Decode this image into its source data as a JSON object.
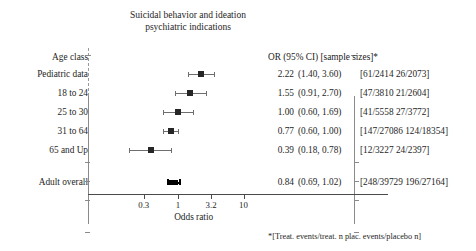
{
  "title": {
    "line1": "Suicidal behavior and ideation",
    "line2": "psychiatric indications"
  },
  "columns": {
    "left_header": "Age class",
    "right_header": "OR (95% CI)   [sample sizes]*"
  },
  "footnote": "*[Treat. events/treat. n   plac. events/placebo n]",
  "axis": {
    "label": "Odds ratio",
    "ticks": [
      "0.3",
      "1",
      "3.2",
      "10"
    ],
    "tick_values": [
      0.3,
      1,
      3.2,
      10
    ],
    "reference_line": 1,
    "scale": "log"
  },
  "colors": {
    "marker": "#262626",
    "overall_marker": "#000000",
    "ci_line": "#6e6e6e",
    "reference_line": "#9a9a9a",
    "axis": "#4a4a4a",
    "text": "#1e1e1e",
    "background": "#ffffff"
  },
  "chart_data": {
    "type": "forest",
    "title": "Suicidal behavior and ideation psychiatric indications",
    "xlabel": "Odds ratio",
    "ylabel": "Age class",
    "xscale": "log",
    "xlim": [
      0.22,
      14
    ],
    "xticks": [
      0.3,
      1,
      3.2,
      10
    ],
    "grid": false,
    "legend": "none",
    "reference_line": 1,
    "annotation": "*[Treat. events/treat. n   plac. events/placebo n]",
    "rows": [
      {
        "label": "Pediatric data",
        "or": 2.22,
        "ci_low": 1.4,
        "ci_high": 3.6,
        "or_text": "2.22",
        "ci_text": "(1.40, 3.60)",
        "samples_text": "[61/2414 26/2073]",
        "treat_events": 61,
        "treat_n": 2414,
        "placebo_events": 26,
        "placebo_n": 2073,
        "overall": false
      },
      {
        "label": "18 to 24",
        "or": 1.55,
        "ci_low": 0.91,
        "ci_high": 2.7,
        "or_text": "1.55",
        "ci_text": "(0.91, 2.70)",
        "samples_text": "[47/3810 21/2604]",
        "treat_events": 47,
        "treat_n": 3810,
        "placebo_events": 21,
        "placebo_n": 2604,
        "overall": false
      },
      {
        "label": "25 to 30",
        "or": 1.0,
        "ci_low": 0.6,
        "ci_high": 1.69,
        "or_text": "1.00",
        "ci_text": "(0.60, 1.69)",
        "samples_text": "[41/5558 27/3772]",
        "treat_events": 41,
        "treat_n": 5558,
        "placebo_events": 27,
        "placebo_n": 3772,
        "overall": false
      },
      {
        "label": "31 to 64",
        "or": 0.77,
        "ci_low": 0.6,
        "ci_high": 1.0,
        "or_text": "0.77",
        "ci_text": "(0.60, 1.00)",
        "samples_text": "[147/27086 124/18354]",
        "treat_events": 147,
        "treat_n": 27086,
        "placebo_events": 124,
        "placebo_n": 18354,
        "overall": false
      },
      {
        "label": "65 and Up",
        "or": 0.39,
        "ci_low": 0.18,
        "ci_high": 0.78,
        "or_text": "0.39",
        "ci_text": "(0.18, 0.78)",
        "samples_text": "[12/3227 24/2397]",
        "treat_events": 12,
        "treat_n": 3227,
        "placebo_events": 24,
        "placebo_n": 2397,
        "overall": false
      },
      {
        "label": "Adult overall",
        "or": 0.84,
        "ci_low": 0.69,
        "ci_high": 1.02,
        "or_text": "0.84",
        "ci_text": "(0.69, 1.02)",
        "samples_text": "[248/39729 196/27164]",
        "treat_events": 248,
        "treat_n": 39729,
        "placebo_events": 196,
        "placebo_n": 27164,
        "overall": true
      }
    ]
  }
}
